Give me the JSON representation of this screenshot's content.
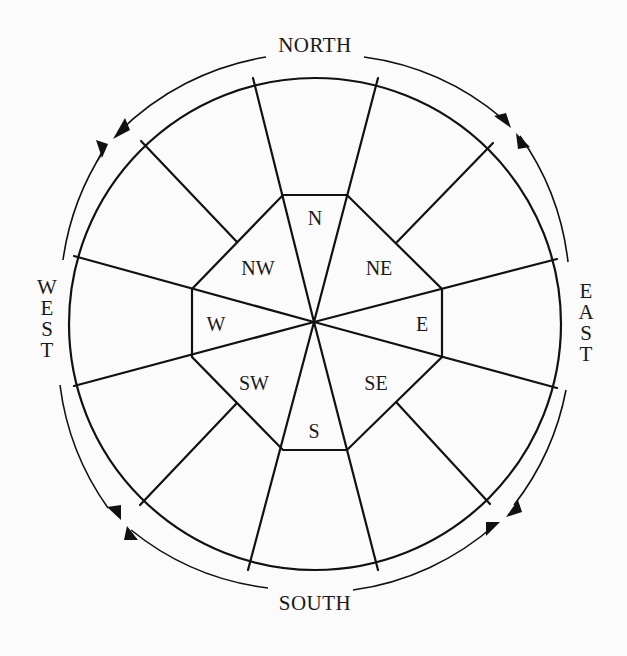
{
  "diagram": {
    "background": "#fbfbfb",
    "stroke_color": "#111111",
    "cardinals": {
      "north": "NORTH",
      "south": "SOUTH",
      "west": [
        "W",
        "E",
        "S",
        "T"
      ],
      "east": [
        "E",
        "A",
        "S",
        "T"
      ]
    },
    "sectors": [
      {
        "id": "n",
        "label": "N"
      },
      {
        "id": "ne",
        "label": "NE"
      },
      {
        "id": "e",
        "label": "E"
      },
      {
        "id": "se",
        "label": "SE"
      },
      {
        "id": "s",
        "label": "S"
      },
      {
        "id": "sw",
        "label": "SW"
      },
      {
        "id": "w",
        "label": "W"
      },
      {
        "id": "nw",
        "label": "NW"
      }
    ],
    "arrows": [
      {
        "position": "top-left",
        "description": "opposing arrowheads on outer ring"
      },
      {
        "position": "top-right",
        "description": "opposing arrowheads on outer ring"
      },
      {
        "position": "bottom-right",
        "description": "opposing arrowheads on outer ring"
      },
      {
        "position": "bottom-left",
        "description": "opposing arrowheads on outer ring"
      }
    ]
  }
}
